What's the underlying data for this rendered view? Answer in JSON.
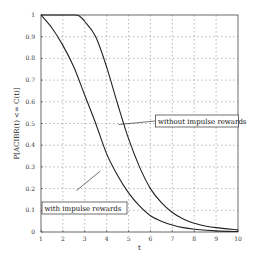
{
  "chart_data": {
    "type": "line",
    "title": "",
    "xlabel": "t",
    "ylabel": "P[ACIBR(t) <= C(t)]",
    "xlim": [
      1,
      10
    ],
    "ylim": [
      0,
      1
    ],
    "grid": true,
    "grid_style": "dotted",
    "x_ticks": [
      "1",
      "2",
      "3",
      "4",
      "5",
      "6",
      "7",
      "8",
      "9",
      "10"
    ],
    "y_ticks": [
      "0",
      "0.1",
      "0.2",
      "0.3",
      "0.4",
      "0.5",
      "0.6",
      "0.7",
      "0.8",
      "0.9",
      "1"
    ],
    "series": [
      {
        "name": "with impulse rewards",
        "x": [
          1,
          1.5,
          2,
          2.5,
          3,
          3.5,
          4,
          4.5,
          5,
          5.5,
          6,
          6.5,
          7,
          7.5,
          8,
          9,
          10
        ],
        "values": [
          1.0,
          0.94,
          0.86,
          0.76,
          0.63,
          0.5,
          0.36,
          0.26,
          0.18,
          0.12,
          0.075,
          0.05,
          0.032,
          0.02,
          0.013,
          0.005,
          0.002
        ]
      },
      {
        "name": "without impulse rewards",
        "x": [
          1,
          1.5,
          2,
          2.5,
          2.75,
          3,
          3.5,
          4,
          4.5,
          5,
          5.5,
          6,
          6.5,
          7,
          7.5,
          8,
          8.5,
          9,
          10
        ],
        "values": [
          1.0,
          1.0,
          1.0,
          1.0,
          0.995,
          0.97,
          0.9,
          0.76,
          0.59,
          0.43,
          0.3,
          0.2,
          0.135,
          0.09,
          0.06,
          0.04,
          0.028,
          0.02,
          0.01
        ]
      }
    ],
    "annotations": [
      {
        "text": "with impulse rewards",
        "box": true,
        "arrow_to": [
          3.7,
          0.28
        ]
      },
      {
        "text": "without impulse rewards",
        "box": true,
        "arrow_to": [
          4.5,
          0.5
        ]
      }
    ],
    "legend_position": "none (boxed annotations with arrows)"
  }
}
